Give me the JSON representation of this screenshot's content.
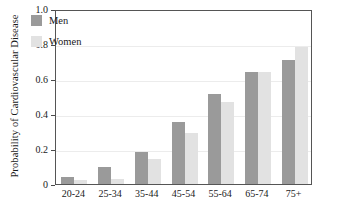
{
  "chart_data": {
    "type": "bar",
    "title": "",
    "xlabel": "",
    "ylabel": "Probability of Cardiovascular Disease",
    "categories": [
      "20-24",
      "25-34",
      "35-44",
      "45-54",
      "55-64",
      "65-74",
      "75+"
    ],
    "series": [
      {
        "name": "Men",
        "color": "#9a9a9a",
        "values": [
          0.04,
          0.095,
          0.185,
          0.355,
          0.515,
          0.64,
          0.71
        ]
      },
      {
        "name": "Women",
        "color": "#e2e2e2",
        "values": [
          0.025,
          0.028,
          0.145,
          0.29,
          0.47,
          0.64,
          0.785
        ]
      }
    ],
    "ylim": [
      0,
      1.0
    ],
    "y_ticks": [
      0,
      0.2,
      0.4,
      0.6,
      0.8,
      1.0
    ],
    "y_tick_labels": [
      "0",
      "0.2",
      "0.4",
      "0.6",
      "0.8",
      "1.0"
    ],
    "grid": true,
    "grid_axis": "y",
    "legend_position": "upper left"
  }
}
